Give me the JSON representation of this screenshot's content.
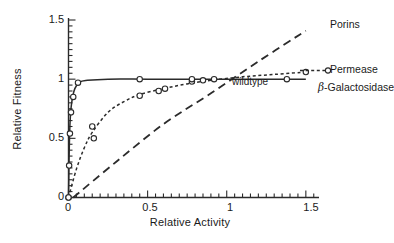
{
  "chart_data": {
    "type": "line",
    "title": "",
    "xlabel": "Relative Activity",
    "ylabel": "Relative Fitness",
    "xlim": [
      0,
      1.58
    ],
    "ylim": [
      0,
      1.5
    ],
    "xticks": [
      "0",
      "0.5",
      "1",
      "1.5"
    ],
    "xtick_values": [
      0,
      0.5,
      1,
      1.5
    ],
    "yticks": [
      "0",
      "0.5",
      "1",
      "1.5"
    ],
    "ytick_values": [
      0,
      0.5,
      1,
      1.5
    ],
    "grid": false,
    "legend": "inline-right",
    "annotations": [
      {
        "text": "wildtype",
        "x": 1.0,
        "y": 0.95
      }
    ],
    "series": [
      {
        "name": "β-Galactosidase",
        "style": "solid",
        "marker": "open-circle",
        "x": [
          0.0,
          0.004,
          0.009,
          0.016,
          0.03,
          0.06,
          0.45,
          0.78,
          1.38
        ],
        "y": [
          0.0,
          0.27,
          0.54,
          0.72,
          0.85,
          0.97,
          1.0,
          1.0,
          1.0
        ],
        "curve_x": [
          0.0,
          0.002,
          0.005,
          0.01,
          0.02,
          0.04,
          0.07,
          0.12,
          0.25,
          0.5,
          0.8,
          1.1,
          1.5
        ],
        "curve_y": [
          0.0,
          0.18,
          0.42,
          0.64,
          0.8,
          0.92,
          0.975,
          0.99,
          1.0,
          1.0,
          1.0,
          1.0,
          1.0
        ]
      },
      {
        "name": "Permease",
        "style": "dotted",
        "marker": "open-circle",
        "x": [
          0.0,
          0.15,
          0.16,
          0.45,
          0.57,
          0.61,
          0.78,
          0.85,
          0.92,
          1.5
        ],
        "y": [
          0.0,
          0.6,
          0.5,
          0.86,
          0.9,
          0.92,
          0.98,
          0.99,
          1.0,
          1.06
        ],
        "curve_x": [
          0.0,
          0.05,
          0.1,
          0.15,
          0.25,
          0.35,
          0.45,
          0.6,
          0.75,
          0.9,
          1.1,
          1.3,
          1.5
        ],
        "curve_y": [
          0.0,
          0.24,
          0.42,
          0.55,
          0.72,
          0.81,
          0.87,
          0.92,
          0.96,
          0.99,
          1.02,
          1.04,
          1.06
        ]
      },
      {
        "name": "Porins",
        "style": "dashed",
        "marker": "none",
        "x": [
          0.03,
          0.25,
          0.5,
          0.75,
          1.0,
          1.25,
          1.5
        ],
        "y": [
          0.0,
          0.27,
          0.52,
          0.74,
          0.97,
          1.2,
          1.41
        ],
        "curve_x": [
          0.03,
          0.3,
          0.6,
          0.9,
          1.2,
          1.5
        ],
        "curve_y": [
          0.0,
          0.3,
          0.62,
          0.88,
          1.15,
          1.41
        ]
      }
    ]
  },
  "axes": {
    "y_title": "Relative Fitness",
    "x_title": "Relative Activity",
    "y_ticks": [
      "1.5",
      "1",
      "0.5",
      "0"
    ],
    "x_ticks": [
      "0",
      "0.5",
      "1",
      "1.5"
    ]
  },
  "labels": {
    "porins": "Porins",
    "permease": "Permease",
    "beta_symbol": "β",
    "beta_galactosidase_rest": "-Galactosidase",
    "wildtype": "wildtype"
  },
  "colors": {
    "line": "#2b2b2b",
    "axis": "#2b2b2b",
    "background": "#ffffff",
    "marker_fill": "#ffffff"
  }
}
